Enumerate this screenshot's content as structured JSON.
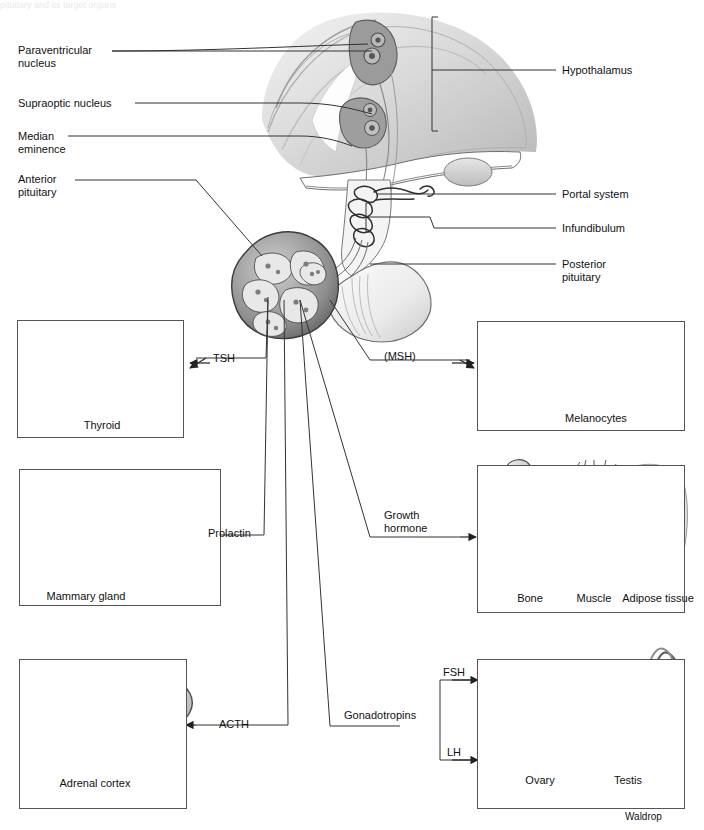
{
  "figure": {
    "top_cut_text": "pituitary and its target organs",
    "signature": "Waldrop"
  },
  "anatomy_labels": {
    "left": [
      {
        "id": "paraventricular-nucleus",
        "text": "Paraventricular\nnucleus"
      },
      {
        "id": "supraoptic-nucleus",
        "text": "Supraoptic nucleus"
      },
      {
        "id": "median-eminence",
        "text": "Median\neminence"
      },
      {
        "id": "anterior-pituitary",
        "text": "Anterior\npituitary"
      }
    ],
    "right": [
      {
        "id": "hypothalamus",
        "text": "Hypothalamus"
      },
      {
        "id": "portal-system",
        "text": "Portal system"
      },
      {
        "id": "infundibulum",
        "text": "Infundibulum"
      },
      {
        "id": "posterior-pituitary",
        "text": "Posterior\npituitary"
      }
    ]
  },
  "hormones": [
    {
      "id": "tsh",
      "label": "TSH"
    },
    {
      "id": "msh",
      "label": "(MSH)"
    },
    {
      "id": "prolactin",
      "label": "Prolactin"
    },
    {
      "id": "growth-hormone",
      "label": "Growth\nhormone"
    },
    {
      "id": "acth",
      "label": "ACTH"
    },
    {
      "id": "gonadotropins",
      "label": "Gonadotropins"
    },
    {
      "id": "fsh",
      "label": "FSH"
    },
    {
      "id": "lh",
      "label": "LH"
    }
  ],
  "target_panels": [
    {
      "id": "thyroid",
      "caption": "Thyroid",
      "inner_labels": []
    },
    {
      "id": "skin",
      "caption": "",
      "inner_labels": [
        "Melanocytes"
      ]
    },
    {
      "id": "mammary",
      "caption": "",
      "inner_labels": [
        "Mammary gland"
      ]
    },
    {
      "id": "growth-targets",
      "caption": "",
      "inner_labels": [
        "Bone",
        "Muscle",
        "Adipose tissue"
      ]
    },
    {
      "id": "adrenal",
      "caption": "",
      "inner_labels": [
        "Adrenal cortex"
      ]
    },
    {
      "id": "gonads",
      "caption": "",
      "inner_labels": [
        "Ovary",
        "Testis"
      ]
    }
  ],
  "colors": {
    "line": "#333333",
    "panel_border": "#555555",
    "text": "#111111",
    "tissue_mid": "#9a9a9a",
    "tissue_light": "#cfcfcf",
    "tissue_dark": "#6b6b6b",
    "background": "#ffffff"
  }
}
